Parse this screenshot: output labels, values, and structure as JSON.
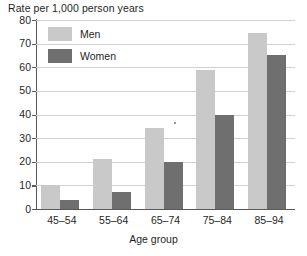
{
  "chart_data": {
    "type": "bar",
    "title": "",
    "ylabel": "Rate per 1,000 person years",
    "xlabel": "Age group",
    "categories": [
      "45–54",
      "55–64",
      "65–74",
      "75–84",
      "85–94"
    ],
    "series": [
      {
        "name": "Men",
        "color": "#c9c9c9",
        "values": [
          10,
          21,
          34.5,
          59,
          74.5
        ]
      },
      {
        "name": "Women",
        "color": "#6f6f6f",
        "values": [
          4,
          7,
          20,
          40,
          65
        ]
      }
    ],
    "ylim": [
      0,
      80
    ],
    "yticks": [
      0,
      10,
      20,
      30,
      40,
      50,
      60,
      70,
      80
    ],
    "ytick_labels": [
      "0",
      "10",
      "20",
      "30",
      "40",
      "50",
      "60",
      "70",
      "80"
    ],
    "grid": true,
    "legend_position": "top-left",
    "legend_entries": [
      "Men",
      "Women"
    ]
  }
}
